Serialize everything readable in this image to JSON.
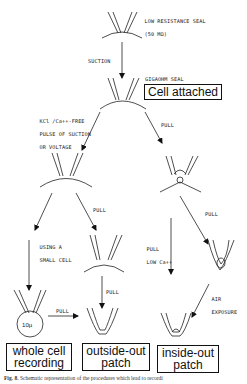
{
  "nodes": {
    "low_resistance_seal": {
      "label_line1": "LOW RESISTANCE SEAL",
      "label_line2": "(50 MΩ)"
    },
    "gigaohm_seal": {
      "label": "GIGAOHM SEAL",
      "state": "Cell attached"
    },
    "whole_cell": {
      "line1": "whole cell",
      "line2": "recording",
      "cell_size": "10µ"
    },
    "outside_out": {
      "line1": "outside-out",
      "line2": "patch"
    },
    "inside_out": {
      "line1": "inside-out",
      "line2": "patch"
    }
  },
  "edges": {
    "suction": "SUCTION",
    "kcl_line1": "KCl /Ca++-FREE",
    "kcl_line2": "PULSE OF SUCTION",
    "kcl_line3": "OR VOLTAGE",
    "pull_right_top": "PULL",
    "pull_mid_left": "PULL",
    "small_cell_line1": "USING A",
    "small_cell_line2": "SMALL CELL",
    "pull_right_mid": "PULL",
    "pull_low_ca_line1": "PULL",
    "pull_low_ca_line2": "LOW Ca++",
    "pull_outside_out": "PULL",
    "pull_whole_to_outside": "PULL",
    "air_line1": "AIR",
    "air_line2": "EXPOSURE"
  },
  "caption": {
    "fig": "Fig. 8.",
    "text": " Schematic representation of the procedures which lead to recordi"
  }
}
